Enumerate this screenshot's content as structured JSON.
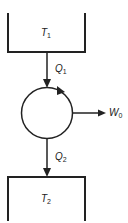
{
  "diagram": {
    "type": "heat-engine",
    "hot_reservoir": {
      "label": "T",
      "subscript": "1"
    },
    "cold_reservoir": {
      "label": "T",
      "subscript": "2"
    },
    "heat_in": {
      "label": "Q",
      "subscript": "1"
    },
    "heat_out": {
      "label": "Q",
      "subscript": "2"
    },
    "work_out": {
      "label": "W",
      "subscript": "0"
    },
    "colors": {
      "stroke": "#222222",
      "background": "#ffffff"
    }
  }
}
